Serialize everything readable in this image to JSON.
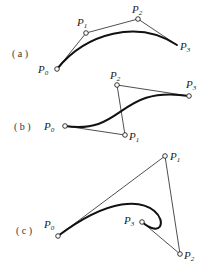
{
  "diagram": {
    "panels": [
      {
        "label": "( a )",
        "points": [
          {
            "name": "P",
            "sub": "0",
            "x": 57,
            "y": 69
          },
          {
            "name": "P",
            "sub": "1",
            "x": 86,
            "y": 33
          },
          {
            "name": "P",
            "sub": "2",
            "x": 138,
            "y": 19
          },
          {
            "name": "P",
            "sub": "3",
            "x": 177,
            "y": 45
          }
        ],
        "show_endpoint_marker": false
      },
      {
        "label": "( b )",
        "points": [
          {
            "name": "P",
            "sub": "0",
            "x": 65,
            "y": 126
          },
          {
            "name": "P",
            "sub": "1",
            "x": 125,
            "y": 135
          },
          {
            "name": "P",
            "sub": "2",
            "x": 117,
            "y": 85
          },
          {
            "name": "P",
            "sub": "3",
            "x": 189,
            "y": 96
          }
        ],
        "show_endpoint_marker": true
      },
      {
        "label": "( c )",
        "points": [
          {
            "name": "P",
            "sub": "0",
            "x": 58,
            "y": 236
          },
          {
            "name": "P",
            "sub": "1",
            "x": 165,
            "y": 156
          },
          {
            "name": "P",
            "sub": "2",
            "x": 180,
            "y": 254
          },
          {
            "name": "P",
            "sub": "3",
            "x": 142,
            "y": 222
          }
        ],
        "show_endpoint_marker": true
      }
    ]
  }
}
